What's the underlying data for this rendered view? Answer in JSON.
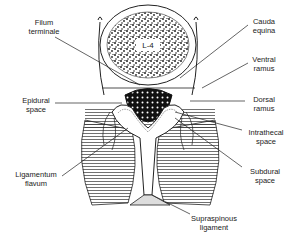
{
  "figure": {
    "vertebra_label": "L-4",
    "labels": {
      "filum_terminale": [
        "Filum",
        "terminale"
      ],
      "cauda_equina": [
        "Cauda",
        "equina"
      ],
      "ventral_ramus": [
        "Ventral",
        "ramus"
      ],
      "epidural_space": [
        "Epidural",
        "space"
      ],
      "dorsal_ramus": [
        "Dorsal",
        "ramus"
      ],
      "intrathecal_space": [
        "Intrathecal",
        "space"
      ],
      "ligamentum_flavum": [
        "Ligamentum",
        "flavum"
      ],
      "subdural_space": [
        "Subdural",
        "space"
      ],
      "supraspinous_ligament": [
        "Supraspinous",
        "ligament"
      ]
    }
  }
}
